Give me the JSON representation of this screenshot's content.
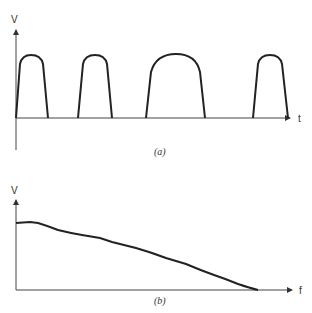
{
  "figure_a": {
    "caption": "(a)",
    "y_axis_label": "V",
    "x_axis_label": "t",
    "description": "Rectified half-sine-like pulses of varying width on time axis",
    "pulses": [
      {
        "start": 16,
        "end": 48
      },
      {
        "start": 78,
        "end": 112
      },
      {
        "start": 146,
        "end": 205
      },
      {
        "start": 253,
        "end": 288
      }
    ]
  },
  "figure_b": {
    "caption": "(b)",
    "y_axis_label": "V",
    "x_axis_label": "f",
    "description": "Voltage spectrum decreasing with frequency to zero"
  },
  "colors": {
    "stroke": "#222222",
    "axis": "#444444",
    "background": "#ffffff"
  }
}
